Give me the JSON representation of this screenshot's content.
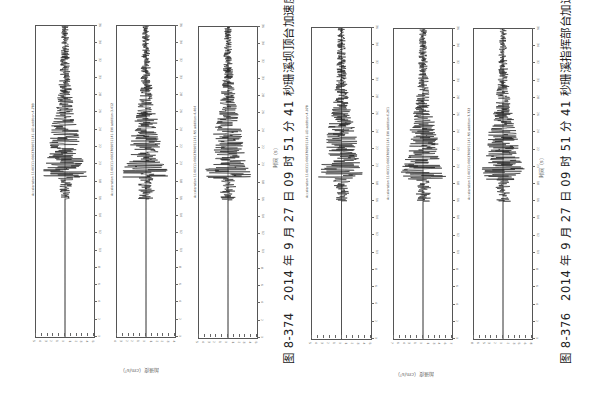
{
  "page": {
    "orientation": "rotated-90",
    "figures": [
      {
        "id": "fig-8-374",
        "caption": "图 8-374　2014 年 9 月 27 日 09 时 51 分 41 秒珊溪坝顶台加速度记录",
        "time_axis_label": "时间（s）",
        "y_axis_label": "加速度（cm/s²）",
        "panels": [
          {
            "annotation": "Acceleration 1140311-6002709051141-UD addition-4.789",
            "x_ticks": [
              "0",
              "2",
              "4",
              "6",
              "8",
              "10",
              "12",
              "14",
              "16",
              "18",
              "20",
              "22",
              "24",
              "26",
              "28",
              "30",
              "32",
              "34",
              "36"
            ]
          },
          {
            "annotation": "Acceleration 1140311-6002709051141-EW addition-3.412",
            "x_ticks": [
              "0",
              "2",
              "4",
              "6",
              "8",
              "10",
              "12",
              "14",
              "16",
              "18",
              "20",
              "22",
              "24",
              "26",
              "28",
              "30",
              "32",
              "34",
              "36"
            ]
          },
          {
            "annotation": "Acceleration 1140311-6002709051141-NS addition-4.404",
            "x_ticks": [
              "0",
              "2",
              "4",
              "6",
              "8",
              "10",
              "12",
              "14",
              "16",
              "18",
              "20",
              "22",
              "24",
              "26",
              "28",
              "30",
              "32",
              "34",
              "36"
            ]
          }
        ]
      },
      {
        "id": "fig-8-376",
        "caption": "图 8-376　2014 年 9 月 27 日 09 时 51 分 41 秒珊溪指挥部台加速度记录",
        "time_axis_label": "时间（s）",
        "y_axis_label": "加速度（cm/s²）",
        "panels": [
          {
            "annotation": "Acceleration 1140311-6002709051141-UD addition-4.078",
            "x_ticks": [
              "0",
              "2",
              "4",
              "6",
              "8",
              "10",
              "12",
              "14",
              "16",
              "18",
              "20",
              "22",
              "24",
              "26",
              "28",
              "30",
              "32",
              "34",
              "36"
            ]
          },
          {
            "annotation": "Acceleration 1140311-6002709051141-EW addition-6.261",
            "x_ticks": [
              "0",
              "2",
              "4",
              "6",
              "8",
              "10",
              "12",
              "14",
              "16",
              "18",
              "20",
              "22",
              "24",
              "26",
              "28",
              "30",
              "32",
              "34",
              "36"
            ]
          },
          {
            "annotation": "Acceleration 1140311-6002709051141-NS addition-7.722",
            "x_ticks": [
              "0",
              "2",
              "4",
              "6",
              "8",
              "10",
              "12",
              "14",
              "16",
              "18",
              "20",
              "22",
              "24",
              "26",
              "28",
              "30",
              "32",
              "34",
              "36"
            ]
          }
        ]
      }
    ]
  },
  "chart_data": [
    {
      "type": "line",
      "title": "Acceleration UD (坝顶台)",
      "xlabel": "时间（s）",
      "ylabel": "加速度（cm/s²）",
      "xlim": [
        0,
        36
      ],
      "ylim": [
        -5,
        5
      ],
      "peak": 4.789,
      "description": "seismic acceleration time history, strong motion ≈ 18–26 s"
    },
    {
      "type": "line",
      "title": "Acceleration EW (坝顶台)",
      "xlabel": "时间（s）",
      "ylabel": "加速度（cm/s²）",
      "xlim": [
        0,
        36
      ],
      "ylim": [
        -4,
        4
      ],
      "peak": 3.412
    },
    {
      "type": "line",
      "title": "Acceleration NS (坝顶台)",
      "xlabel": "时间（s）",
      "ylabel": "加速度（cm/s²）",
      "xlim": [
        0,
        36
      ],
      "ylim": [
        -5,
        5
      ],
      "peak": 4.404
    },
    {
      "type": "line",
      "title": "Acceleration UD (指挥部台)",
      "xlabel": "时间（s）",
      "ylabel": "加速度（cm/s²）",
      "xlim": [
        0,
        36
      ],
      "ylim": [
        -5,
        5
      ],
      "peak": 4.078
    },
    {
      "type": "line",
      "title": "Acceleration EW (指挥部台)",
      "xlabel": "时间（s）",
      "ylabel": "加速度（cm/s²）",
      "xlim": [
        0,
        36
      ],
      "ylim": [
        -7,
        7
      ],
      "peak": 6.261
    },
    {
      "type": "line",
      "title": "Acceleration NS (指挥部台)",
      "xlabel": "时间（s）",
      "ylabel": "加速度（cm/s²）",
      "xlim": [
        0,
        36
      ],
      "ylim": [
        -8,
        8
      ],
      "peak": 7.722
    }
  ]
}
